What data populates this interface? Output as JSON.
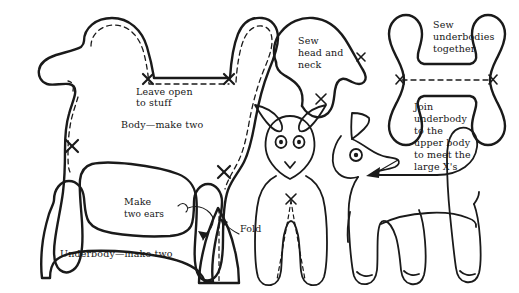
{
  "figure": {
    "type": "line-drawing-pattern",
    "ink_color": "#1a1a1a",
    "background_color": "#ffffff",
    "width": 519,
    "height": 293
  },
  "annotations": {
    "leave_open": {
      "line1": "Leave open",
      "line2": "to stuff"
    },
    "body_make_two": {
      "line1": "Body—make two"
    },
    "sew_head_neck": {
      "line1": "Sew",
      "line2": "head and",
      "line3": "neck"
    },
    "sew_underbodies": {
      "line1": "Sew",
      "line2": "underbodies",
      "line3": "together"
    },
    "join_underbody": {
      "line1": "Join",
      "line2": "underbody",
      "line3": "to the",
      "line4": "upper body",
      "line5": "to meet the",
      "line6": "large X's"
    },
    "make_two_ears": {
      "line1": "Make",
      "line2": "two ears"
    },
    "fold": {
      "line1": "Fold"
    },
    "underbody_make_two": {
      "line1": "Underbody—make two"
    }
  },
  "pieces": [
    {
      "name": "body-piece",
      "label": "Body—make two",
      "marks": "4 large X marks, dashed seam line"
    },
    {
      "name": "head-neck-piece",
      "label": "Sew head and neck",
      "marks": "2 small X marks"
    },
    {
      "name": "underbody-piece-top-right",
      "label": "Sew underbodies together",
      "marks": "2 small X marks joined by dashed line"
    },
    {
      "name": "underbody-piece-bottom-left",
      "label": "Underbody—make two",
      "marks": "none"
    },
    {
      "name": "ear-piece",
      "label": "Make two ears",
      "marks": "dashed fold line"
    }
  ],
  "illustrations": [
    {
      "name": "deer-front-view",
      "description": "front-facing fawn with large ears and two eyes, dashed leg seam, X mark on chest"
    },
    {
      "name": "deer-side-view",
      "description": "side-profile fawn facing right with one eye and pointed ear"
    }
  ]
}
